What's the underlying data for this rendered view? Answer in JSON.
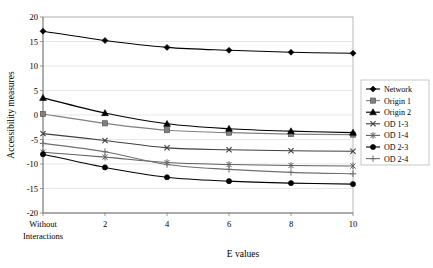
{
  "chart_data": {
    "type": "line",
    "title": "",
    "xlabel": "E values",
    "ylabel": "Accessibility measures",
    "x": [
      0,
      2,
      4,
      6,
      8,
      10
    ],
    "xtick_labels": [
      "Without Interactions",
      "2",
      "4",
      "6",
      "8",
      "10"
    ],
    "xtick_label_first_line": "Without",
    "xtick_label_second_line": "Interactions",
    "ylim": [
      -20,
      20
    ],
    "ytick_labels": [
      "20",
      "15",
      "10",
      "5",
      "0",
      "-5",
      "-10",
      "-15",
      "-20"
    ],
    "yticks": [
      20,
      15,
      10,
      5,
      0,
      -5,
      -10,
      -15,
      -20
    ],
    "grid": true,
    "legend_position": "right",
    "series": [
      {
        "name": "Network",
        "marker": "diamond",
        "color": "#000000",
        "values": [
          17.1,
          15.2,
          13.8,
          13.2,
          12.8,
          12.6
        ]
      },
      {
        "name": "Origin 1",
        "marker": "square",
        "color": "#808080",
        "values": [
          0.2,
          -1.7,
          -3.1,
          -3.6,
          -3.9,
          -4.0
        ]
      },
      {
        "name": "Origin 2",
        "marker": "triangle",
        "color": "#000000",
        "values": [
          3.5,
          0.4,
          -1.8,
          -2.8,
          -3.3,
          -3.6
        ]
      },
      {
        "name": "OD 1-3",
        "marker": "cross-x",
        "color": "#404040",
        "values": [
          -3.8,
          -5.2,
          -6.7,
          -7.1,
          -7.3,
          -7.4
        ]
      },
      {
        "name": "OD 1-4",
        "marker": "star",
        "color": "#606060",
        "values": [
          -7.6,
          -8.6,
          -9.7,
          -10.1,
          -10.3,
          -10.4
        ]
      },
      {
        "name": "OD 2-3",
        "marker": "circle",
        "color": "#000000",
        "values": [
          -8.0,
          -10.7,
          -12.7,
          -13.5,
          -13.9,
          -14.1
        ]
      },
      {
        "name": "OD 2-4",
        "marker": "plus",
        "color": "#707070",
        "values": [
          -5.8,
          -7.5,
          -10.1,
          -11.1,
          -11.7,
          -12.0
        ]
      }
    ]
  },
  "legend": {
    "items": [
      {
        "label": "Network"
      },
      {
        "label": "Origin 1"
      },
      {
        "label": "Origin 2"
      },
      {
        "label": "OD 1-3"
      },
      {
        "label": "OD 1-4"
      },
      {
        "label": "OD 2-3"
      },
      {
        "label": "OD 2-4"
      }
    ]
  }
}
